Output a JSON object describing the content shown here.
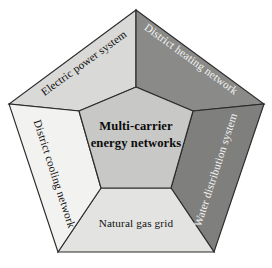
{
  "diagram": {
    "type": "pentagon-segmented",
    "title": "Multi-carrier energy networks",
    "center": {
      "label_line1": "Multi-carrier",
      "label_line2": "energy networks",
      "fill_color": "#c8c8c6",
      "text_color": "#0b0b0b"
    },
    "outline_color": "#2b2b2b",
    "background_color": "#ffffff",
    "facets": [
      {
        "id": "electric-power-system",
        "label": "Electric power system",
        "fill_color": "#d9d9d7",
        "text_color": "#111111",
        "rotation_deg": -36,
        "position": "top-left"
      },
      {
        "id": "district-heating-network",
        "label": "District heating network",
        "fill_color": "#8a8a88",
        "text_color": "#f4f4f2",
        "rotation_deg": 36,
        "position": "top-right"
      },
      {
        "id": "water-distribution-system",
        "label": "Water distribution system",
        "fill_color": "#7f7f7d",
        "text_color": "#f4f4f2",
        "rotation_deg": -72,
        "position": "right"
      },
      {
        "id": "natural-gas-grid",
        "label": "Natural gas grid",
        "fill_color": "#e3e3e1",
        "text_color": "#111111",
        "rotation_deg": 0,
        "position": "bottom"
      },
      {
        "id": "district-cooling-network",
        "label": "District cooling network",
        "fill_color": "#f2f2f0",
        "text_color": "#111111",
        "rotation_deg": 72,
        "position": "left"
      }
    ]
  }
}
